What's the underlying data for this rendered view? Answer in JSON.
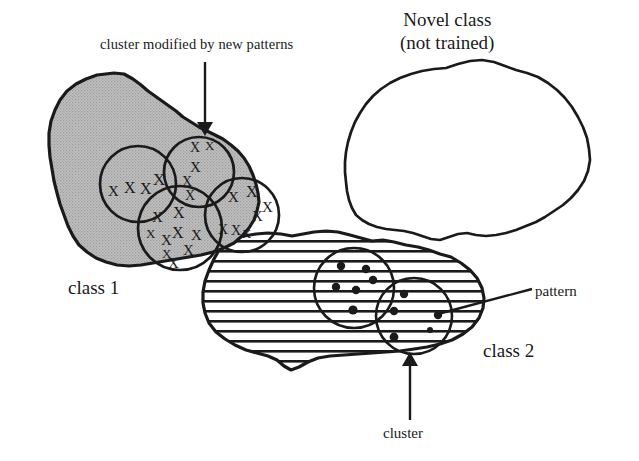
{
  "figure": {
    "kind": "concept-diagram",
    "background_color": "#ffffff",
    "ink_color": "#1a1a1a"
  },
  "labels": {
    "cluster_modified": "cluster modified by new patterns",
    "novel_class_line1": "Novel class",
    "novel_class_line2": "(not trained)",
    "class1": "class 1",
    "class2": "class 2",
    "pattern": "pattern",
    "cluster": "cluster"
  },
  "regions": [
    {
      "name": "class-1-region",
      "label": "class 1",
      "fill": "#b8b8b8",
      "fill_style": "solid-gray-halftone",
      "stroke": "#1a1a1a",
      "stroke_width": 3
    },
    {
      "name": "class-2-region",
      "label": "class 2",
      "fill": "#ffffff",
      "fill_style": "horizontal-hatch",
      "hatch_spacing_px": 10,
      "hatch_line_width_px": 2.4,
      "stroke": "#1a1a1a",
      "stroke_width": 3
    },
    {
      "name": "novel-class-region",
      "label": "Novel class (not trained)",
      "fill": "#ffffff",
      "fill_style": "empty",
      "stroke": "#1a1a1a",
      "stroke_width": 2.6
    }
  ],
  "clusters": [
    {
      "name": "cluster-class1-left",
      "member_glyph": "X",
      "member_count": 4,
      "radius": 38
    },
    {
      "name": "cluster-class1-modified",
      "member_glyph": "X",
      "member_count": 5,
      "radius": 35,
      "annotated_by": "cluster modified by new patterns"
    },
    {
      "name": "cluster-class1-bottom",
      "member_glyph": "X",
      "member_count": 9,
      "radius": 42
    },
    {
      "name": "cluster-class1-right",
      "member_glyph": "X",
      "member_count": 7,
      "radius": 37
    },
    {
      "name": "cluster-class2-left",
      "member_glyph": "dot",
      "member_count": 6,
      "radius": 40,
      "annotated_by": "cluster"
    },
    {
      "name": "cluster-class2-right",
      "member_glyph": "dot",
      "member_count": 5,
      "radius": 38,
      "annotated_by": "pattern"
    }
  ],
  "annotations": [
    {
      "name": "arrow-cluster-modified",
      "from": "cluster modified by new patterns",
      "to": "cluster-class1-modified",
      "style": "vertical-arrow-down"
    },
    {
      "name": "arrow-cluster-bottom",
      "from": "cluster",
      "to": "cluster-class2-right",
      "style": "vertical-arrow-up"
    },
    {
      "name": "leader-pattern",
      "from": "pattern",
      "to": "single dot inside cluster-class2-right",
      "style": "diagonal-leader-line"
    }
  ]
}
